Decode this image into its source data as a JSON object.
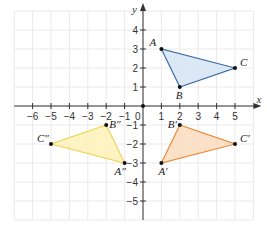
{
  "diagram": {
    "title": "",
    "axes": {
      "x_label": "x",
      "y_label": "y",
      "origin_label": "0",
      "x_range": [
        -7,
        6
      ],
      "y_range": [
        -6,
        5
      ],
      "x_ticks": [
        -6,
        -5,
        -4,
        -3,
        -2,
        -1,
        1,
        2,
        3,
        4,
        5
      ],
      "y_ticks": [
        -5,
        -4,
        -3,
        -2,
        -1,
        1,
        2,
        3,
        4
      ]
    },
    "triangles": [
      {
        "name": "ABC",
        "fill": "#d6e4f5",
        "stroke": "#3a6ea5",
        "vertices": [
          {
            "label": "A",
            "x": 1,
            "y": 3
          },
          {
            "label": "B",
            "x": 2,
            "y": 1
          },
          {
            "label": "C",
            "x": 5,
            "y": 2
          }
        ]
      },
      {
        "name": "A'B'C'",
        "fill": "#fbdcbf",
        "stroke": "#e88a3c",
        "vertices": [
          {
            "label": "A'",
            "x": 1,
            "y": -3
          },
          {
            "label": "B'",
            "x": 2,
            "y": -1
          },
          {
            "label": "C'",
            "x": 5,
            "y": -2
          }
        ]
      },
      {
        "name": "A''B''C''",
        "fill": "#fdf1b8",
        "stroke": "#f1d35a",
        "vertices": [
          {
            "label": "A''",
            "x": -1,
            "y": -3
          },
          {
            "label": "B''",
            "x": -2,
            "y": -1
          },
          {
            "label": "C''",
            "x": -5,
            "y": -2
          }
        ]
      }
    ]
  }
}
